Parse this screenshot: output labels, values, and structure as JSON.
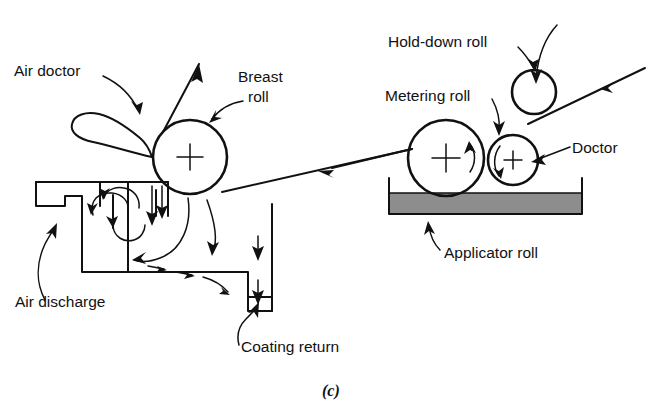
{
  "figure": {
    "caption": "(c)",
    "type": "technical-diagram"
  },
  "labels": {
    "air_doctor": "Air doctor",
    "breast_roll": "Breast roll",
    "breast_roll_line1": "Breast",
    "breast_roll_line2": "roll",
    "air_discharge": "Air discharge",
    "coating_return": "Coating return",
    "hold_down_roll": "Hold-down roll",
    "metering_roll": "Metering roll",
    "doctor": "Doctor",
    "applicator_roll": "Applicator roll"
  },
  "components": {
    "rolls": [
      {
        "name": "breast-roll",
        "label": "Breast roll",
        "cx": 190,
        "cy": 157,
        "r": 37,
        "center_mark": "cross"
      },
      {
        "name": "metering-roll",
        "label": "Metering roll",
        "cx": 446,
        "cy": 158,
        "r": 38,
        "center_mark": "cross"
      },
      {
        "name": "doctor-roll",
        "label": "Doctor",
        "cx": 513,
        "cy": 160,
        "r": 25,
        "center_mark": "cross"
      },
      {
        "name": "hold-down-roll",
        "label": "Hold-down roll",
        "cx": 534,
        "cy": 92,
        "r": 22,
        "center_mark": "none"
      }
    ],
    "pan": {
      "name": "coating-pan",
      "x": 386,
      "y": 178,
      "width": 199,
      "height": 37,
      "fill_color": "#8d8d8d",
      "liquid_top": 193
    },
    "air_doctor_blade": {
      "name": "air-doctor-blade",
      "shape": "teardrop",
      "tip_x": 152,
      "tip_y": 157
    }
  },
  "colors": {
    "line": "#111111",
    "background": "#ffffff",
    "pan_fill": "#8d8d8d"
  }
}
